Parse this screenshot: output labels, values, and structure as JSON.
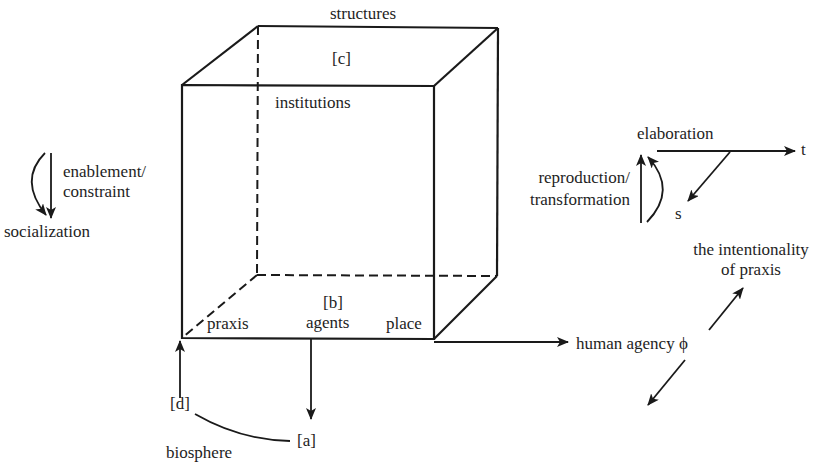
{
  "diagram": {
    "cube": {
      "top_label": "structures",
      "top_marker": "[c]",
      "front_top_label": "institutions",
      "bottom_marker": "[b]",
      "bottom_left_label": "praxis",
      "bottom_center_label": "agents",
      "bottom_right_label": "place"
    },
    "left_cycle": {
      "line1": "enablement/",
      "line2": "constraint",
      "bottom_label": "socialization"
    },
    "right_cycle": {
      "top_label": "elaboration",
      "axis_t": "t",
      "axis_s": "s",
      "line1": "reproduction/",
      "line2": "transformation"
    },
    "agency_axis": {
      "label": "human agency ϕ",
      "upper_line1": "the intentionality",
      "upper_line2": "of praxis"
    },
    "biosphere": {
      "marker_d": "[d]",
      "marker_a": "[a]",
      "label": "biosphere"
    }
  }
}
